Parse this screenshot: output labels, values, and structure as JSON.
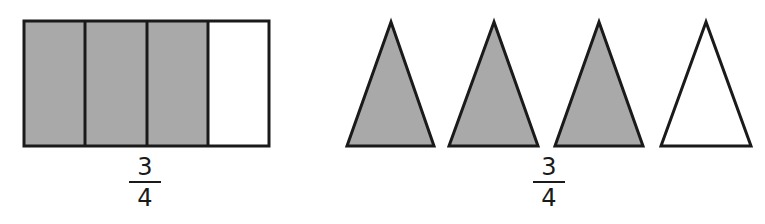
{
  "colors": {
    "shaded": "#a9a9a9",
    "unshaded": "#ffffff",
    "stroke": "#1a1a1a"
  },
  "figures": [
    {
      "kind": "rectangle-partitioned",
      "parts": 4,
      "shaded_parts": 3,
      "fraction": {
        "numerator": "3",
        "denominator": "4"
      }
    },
    {
      "kind": "triangle-set",
      "count": 4,
      "shaded_count": 3,
      "fraction": {
        "numerator": "3",
        "denominator": "4"
      }
    }
  ]
}
